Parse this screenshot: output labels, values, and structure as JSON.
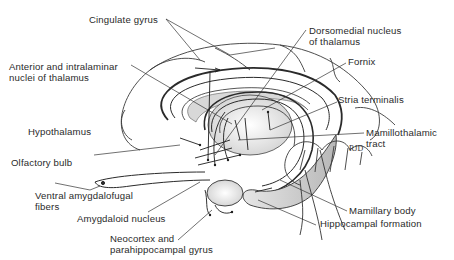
{
  "diagram": {
    "type": "anatomical-illustration",
    "signature": "RJD",
    "labels": {
      "cingulate_gyrus": "Cingulate gyrus",
      "anterior_intralaminar_1": "Anterior and intralaminar",
      "anterior_intralaminar_2": "nuclei of thalamus",
      "hypothalamus": "Hypothalamus",
      "olfactory_bulb": "Olfactory bulb",
      "ventral_amygdalofugal_1": "Ventral amygdalofugal",
      "ventral_amygdalofugal_2": "fibers",
      "amygdaloid_nucleus": "Amygdaloid nucleus",
      "neocortex_1": "Neocortex and",
      "neocortex_2": "parahippocampal gyrus",
      "dorsomedial_1": "Dorsomedial nucleus",
      "dorsomedial_2": "of thalamus",
      "fornix": "Fornix",
      "stria_terminalis": "Stria terminalis",
      "mamillothalamic_1": "Mamillothalamic",
      "mamillothalamic_2": "tract",
      "mamillary_body": "Mamillary body",
      "hippocampal_formation": "Hippocampal formation"
    },
    "colors": {
      "ink": "#2a2a2a",
      "shade": "#bdbdbd",
      "background": "#ffffff"
    }
  }
}
